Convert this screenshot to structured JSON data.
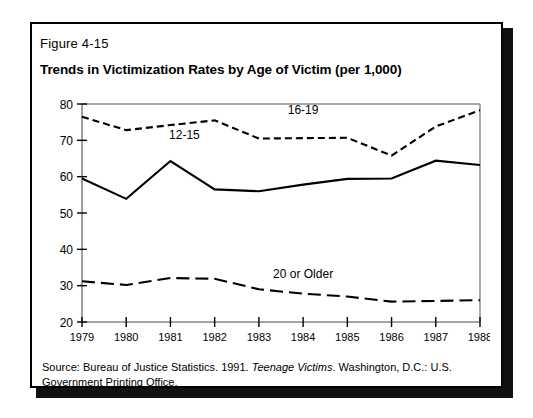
{
  "figure": {
    "number": "Figure 4-15",
    "title": "Trends in Victimization Rates by Age of Victim (per 1,000)",
    "source_prefix": "Source: Bureau of Justice Statistics. 1991. ",
    "source_italic": "Teenage Victims",
    "source_suffix": ". Washington, D.C.: U.S. Government Printing Office."
  },
  "chart_data": {
    "type": "line",
    "title": "Trends in Victimization Rates by Age of Victim (per 1,000)",
    "xlabel": "",
    "ylabel": "",
    "x": [
      "1979",
      "1980",
      "1981",
      "1982",
      "1983",
      "1984",
      "1985",
      "1986",
      "1987",
      "1988"
    ],
    "xlim": [
      1979,
      1988
    ],
    "ylim": [
      20,
      80
    ],
    "yticks": [
      "20",
      "30",
      "40",
      "50",
      "60",
      "70",
      "80"
    ],
    "grid": false,
    "legend_position": "inline-annotations",
    "series": [
      {
        "name": "16-19",
        "style": "dotted",
        "color": "#000000",
        "label_x": "1984",
        "values": [
          76.5,
          72.8,
          74.2,
          75.5,
          70.5,
          70.6,
          70.7,
          65.8,
          73.8,
          78.3
        ]
      },
      {
        "name": "12-15",
        "style": "solid",
        "color": "#000000",
        "label_x": "1981",
        "values": [
          59.5,
          53.9,
          64.3,
          56.5,
          56.0,
          57.8,
          59.4,
          59.5,
          64.4,
          63.2
        ]
      },
      {
        "name": "20 or Older",
        "style": "dashed",
        "color": "#000000",
        "label_x": "1984",
        "values": [
          31.2,
          30.2,
          32.1,
          31.9,
          29.0,
          27.8,
          27.0,
          25.6,
          25.8,
          26.0
        ]
      }
    ]
  }
}
